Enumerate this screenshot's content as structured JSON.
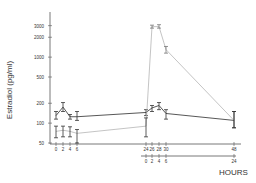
{
  "chart_data": {
    "type": "line",
    "title": "",
    "ylabel": "Estradiol (pg/ml)",
    "xlabel": "HOURS",
    "yscale": "log",
    "ylim": [
      50,
      4000
    ],
    "yticks": [
      50,
      100,
      200,
      500,
      1000,
      2000,
      3000
    ],
    "xaxis_primary_ticks": [
      0,
      2,
      4,
      6,
      24,
      26,
      28,
      30,
      48
    ],
    "xaxis_secondary_ticks": [
      0,
      2,
      4,
      6,
      24
    ],
    "grid": false,
    "legend": null,
    "series": [
      {
        "name": "Series A (dark)",
        "color": "#444444",
        "x": [
          0,
          2,
          4,
          6,
          24,
          26,
          28,
          30,
          48
        ],
        "values": [
          130,
          175,
          125,
          125,
          145,
          170,
          185,
          140,
          110
        ],
        "err_low": [
          115,
          150,
          115,
          110,
          130,
          150,
          160,
          115,
          85
        ],
        "err_high": [
          150,
          205,
          135,
          150,
          160,
          185,
          205,
          160,
          150
        ]
      },
      {
        "name": "Series B (light)",
        "color": "#aaaaaa",
        "x": [
          0,
          2,
          4,
          6,
          24,
          26,
          28,
          30,
          48
        ],
        "values": [
          75,
          78,
          75,
          70,
          90,
          2900,
          2900,
          1300,
          110
        ],
        "err_low": [
          60,
          62,
          62,
          50,
          62,
          2750,
          2750,
          1150,
          85
        ],
        "err_high": [
          90,
          90,
          88,
          80,
          120,
          3050,
          3100,
          1450,
          150
        ]
      }
    ]
  },
  "labels": {
    "ylabel": "Estradiol (pg/ml)",
    "xlabel": "HOURS",
    "ytick_labels": [
      "3000",
      "2000",
      "1000",
      "500",
      "200",
      "100",
      "50"
    ],
    "xtick_primary_labels": [
      "0",
      "2",
      "4",
      "6",
      "24",
      "26",
      "28",
      "30",
      "48"
    ],
    "xtick_secondary_labels": [
      "0",
      "2",
      "4",
      "6",
      "24"
    ]
  }
}
